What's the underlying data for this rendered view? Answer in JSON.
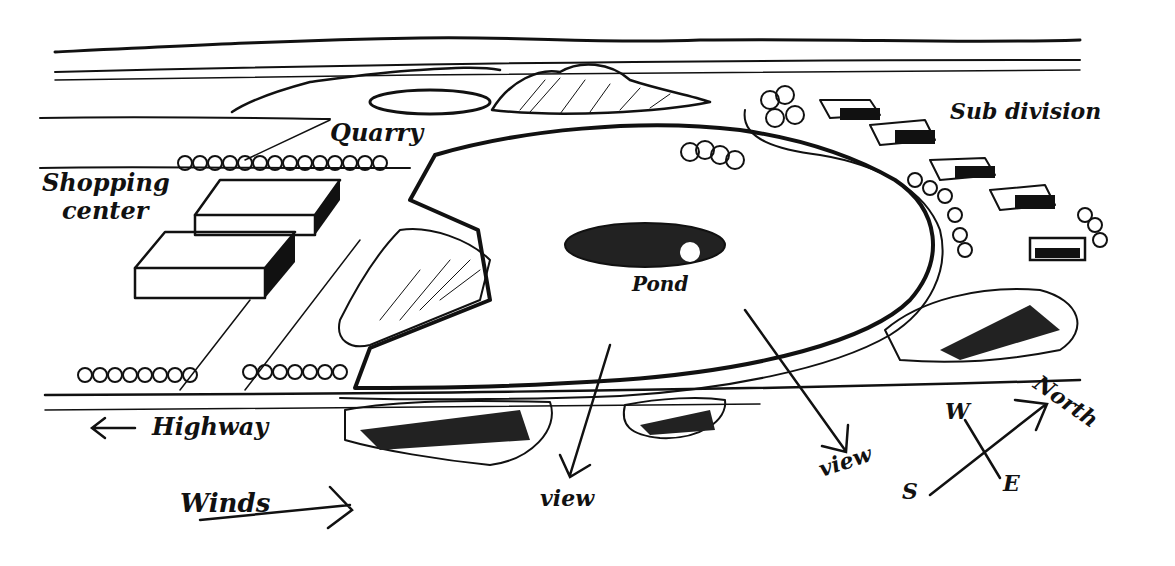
{
  "diagram": {
    "type": "site-analysis-sketch",
    "ink_color": "#111111",
    "background": "#ffffff",
    "labels": {
      "shopping_center_line1": "Shopping",
      "shopping_center_line2": "center",
      "quarry": "Quarry",
      "subdivision": "Sub division",
      "pond": "Pond",
      "highway": "Highway",
      "winds": "Winds",
      "view_left": "view",
      "view_right": "view",
      "north": "North",
      "compass_w": "W",
      "compass_e": "E",
      "compass_s": "S"
    },
    "arrows": [
      {
        "name": "highway-arrow",
        "direction": "west"
      },
      {
        "name": "winds-arrow",
        "direction": "east"
      },
      {
        "name": "view-arrow-left",
        "direction": "south"
      },
      {
        "name": "view-arrow-right",
        "direction": "south-east"
      },
      {
        "name": "north-arrow",
        "direction": "north-east"
      }
    ]
  }
}
